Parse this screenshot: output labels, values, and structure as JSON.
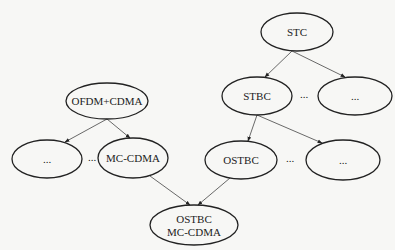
{
  "diagram": {
    "nodes": [
      {
        "id": "stc",
        "label": "STC",
        "lines": [
          "STC"
        ],
        "cx": 297,
        "cy": 32,
        "rx": 36,
        "ry": 19
      },
      {
        "id": "stbc",
        "label": "STBC",
        "lines": [
          "STBC"
        ],
        "cx": 257,
        "cy": 96,
        "rx": 35,
        "ry": 19
      },
      {
        "id": "stc-other",
        "label": "...",
        "lines": [
          "..."
        ],
        "cx": 355,
        "cy": 96,
        "rx": 37,
        "ry": 19
      },
      {
        "id": "ofdm-cdma",
        "label": "OFDM+CDMA",
        "lines": [
          "OFDM+CDMA"
        ],
        "cx": 107,
        "cy": 101,
        "rx": 41,
        "ry": 18
      },
      {
        "id": "ofdm-other",
        "label": "...",
        "lines": [
          "..."
        ],
        "cx": 47,
        "cy": 159,
        "rx": 35,
        "ry": 19
      },
      {
        "id": "mc-cdma",
        "label": "MC-CDMA",
        "lines": [
          "MC-CDMA"
        ],
        "cx": 133,
        "cy": 158,
        "rx": 35,
        "ry": 20
      },
      {
        "id": "ostbc",
        "label": "OSTBC",
        "lines": [
          "OSTBC"
        ],
        "cx": 241,
        "cy": 160,
        "rx": 36,
        "ry": 19
      },
      {
        "id": "stbc-other",
        "label": "...",
        "lines": [
          "..."
        ],
        "cx": 343,
        "cy": 160,
        "rx": 37,
        "ry": 20
      },
      {
        "id": "ostbc-mc-cdma",
        "label": "OSTBC MC-CDMA",
        "lines": [
          "OSTBC",
          "MC-CDMA"
        ],
        "cx": 194,
        "cy": 225,
        "rx": 44,
        "ry": 20
      }
    ],
    "edges": [
      {
        "from": "stc",
        "to": "stbc",
        "x1": 292,
        "y1": 51,
        "x2": 265,
        "y2": 77
      },
      {
        "from": "stc",
        "to": "stc-other",
        "x1": 292,
        "y1": 51,
        "x2": 345,
        "y2": 77
      },
      {
        "from": "stbc",
        "to": "ostbc",
        "x1": 257,
        "y1": 115,
        "x2": 248,
        "y2": 141
      },
      {
        "from": "stbc",
        "to": "stbc-other",
        "x1": 257,
        "y1": 115,
        "x2": 322,
        "y2": 143
      },
      {
        "from": "ofdm-cdma",
        "to": "ofdm-other",
        "x1": 107,
        "y1": 119,
        "x2": 65,
        "y2": 142
      },
      {
        "from": "ofdm-cdma",
        "to": "mc-cdma",
        "x1": 107,
        "y1": 119,
        "x2": 130,
        "y2": 138
      },
      {
        "from": "mc-cdma",
        "to": "ostbc-mc-cdma",
        "x1": 150,
        "y1": 176,
        "x2": 190,
        "y2": 205
      },
      {
        "from": "ostbc",
        "to": "ostbc-mc-cdma",
        "x1": 230,
        "y1": 178,
        "x2": 198,
        "y2": 205
      }
    ],
    "ellipsis_labels": [
      {
        "id": "dots-stc-row",
        "text": "...",
        "x": 304,
        "y": 98
      },
      {
        "id": "dots-ofdm-row",
        "text": "...",
        "x": 92,
        "y": 161
      },
      {
        "id": "dots-stbc-row",
        "text": "...",
        "x": 290,
        "y": 162
      }
    ]
  }
}
